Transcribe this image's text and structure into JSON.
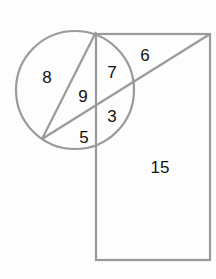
{
  "diagram": {
    "stroke_color": "#9a9a9a",
    "label_color": "#111111",
    "shapes": {
      "circle": {
        "cx": 75,
        "cy": 90,
        "r": 59
      },
      "rectangle": {
        "x": 96,
        "y": 34,
        "width": 114,
        "height": 226
      },
      "chord": {
        "x1": 96,
        "y1": 32,
        "x2": 42,
        "y2": 139
      },
      "diagonal": {
        "x1": 210,
        "y1": 34,
        "x2": 42,
        "y2": 139
      }
    },
    "labels": [
      {
        "id": "region-8",
        "text": "8"
      },
      {
        "id": "region-7",
        "text": "7"
      },
      {
        "id": "region-6",
        "text": "6"
      },
      {
        "id": "region-9",
        "text": "9"
      },
      {
        "id": "region-3",
        "text": "3"
      },
      {
        "id": "region-5",
        "text": "5"
      },
      {
        "id": "region-15",
        "text": "15"
      }
    ]
  }
}
